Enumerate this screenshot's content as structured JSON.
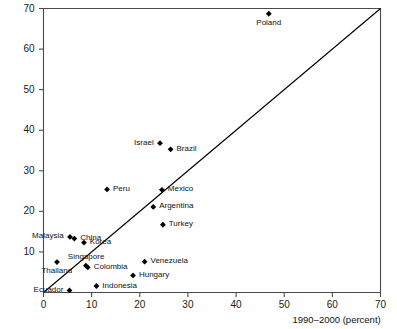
{
  "chart_data": {
    "type": "scatter",
    "title": "",
    "xlabel": "1990–2000  (percent)",
    "ylabel": "",
    "xlim": [
      0,
      70
    ],
    "ylim": [
      0,
      70
    ],
    "xticks": [
      0,
      10,
      20,
      30,
      40,
      50,
      60,
      70
    ],
    "yticks": [
      10,
      20,
      30,
      40,
      50,
      60,
      70
    ],
    "xtick_labels": [
      "0",
      "10",
      "20",
      "30",
      "40",
      "50",
      "60",
      "70"
    ],
    "ytick_labels": [
      "10",
      "20",
      "30",
      "40",
      "50",
      "60",
      "70"
    ],
    "grid": false,
    "legend": null,
    "reference_line": {
      "name": "45-degree-line",
      "from": [
        0,
        0
      ],
      "to": [
        70,
        70
      ],
      "color": "#000000"
    },
    "marker_color": "#000000",
    "points": [
      {
        "label": "Poland",
        "x": 46.8,
        "y": 68.7,
        "label_pos": "below"
      },
      {
        "label": "Israel",
        "x": 24.2,
        "y": 36.8,
        "label_pos": "left"
      },
      {
        "label": "Brazil",
        "x": 26.4,
        "y": 35.3,
        "label_pos": "right"
      },
      {
        "label": "Peru",
        "x": 13.2,
        "y": 25.4,
        "label_pos": "right"
      },
      {
        "label": "Mexico",
        "x": 24.6,
        "y": 25.3,
        "label_pos": "right"
      },
      {
        "label": "Argentina",
        "x": 22.8,
        "y": 21.1,
        "label_pos": "right"
      },
      {
        "label": "Turkey",
        "x": 24.8,
        "y": 16.7,
        "label_pos": "right"
      },
      {
        "label": "Malaysia",
        "x": 5.5,
        "y": 13.7,
        "label_pos": "left"
      },
      {
        "label": "China",
        "x": 6.4,
        "y": 13.3,
        "label_pos": "right"
      },
      {
        "label": "Korea",
        "x": 8.4,
        "y": 12.3,
        "label_pos": "right"
      },
      {
        "label": "Venezuela",
        "x": 21.0,
        "y": 7.6,
        "label_pos": "right"
      },
      {
        "label": "Thailand",
        "x": 2.8,
        "y": 7.5,
        "label_pos": "below"
      },
      {
        "label": "Singapore",
        "x": 8.8,
        "y": 6.6,
        "label_pos": "above"
      },
      {
        "label": "Colombia",
        "x": 9.2,
        "y": 6.2,
        "label_pos": "right"
      },
      {
        "label": "Hungary",
        "x": 18.6,
        "y": 4.2,
        "label_pos": "right"
      },
      {
        "label": "Indonesia",
        "x": 11.0,
        "y": 1.6,
        "label_pos": "right"
      },
      {
        "label": "Ecuador",
        "x": 5.4,
        "y": 0.5,
        "label_pos": "left"
      }
    ]
  }
}
